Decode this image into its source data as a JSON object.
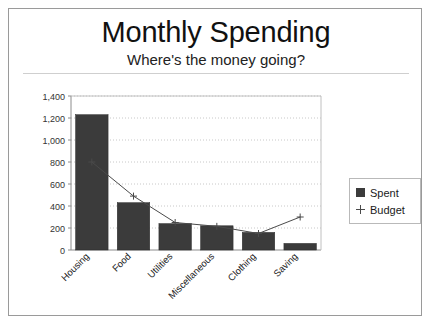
{
  "card": {
    "title": "Monthly Spending",
    "subtitle": "Where's the money going?"
  },
  "legend": {
    "position": "right",
    "items": [
      {
        "label": "Spent",
        "marker": "filled-square",
        "color": "#3b3b3b"
      },
      {
        "label": "Budget",
        "marker": "plus",
        "color": "#4a4a4a"
      }
    ]
  },
  "axis": {
    "y_ticks": [
      "0",
      "200",
      "400",
      "600",
      "800",
      "1,000",
      "1,200",
      "1,400"
    ],
    "x_ticks": [
      "Housing",
      "Food",
      "Utilities",
      "Miscellaneous",
      "Clothing",
      "Saving"
    ]
  },
  "chart_data": {
    "type": "bar",
    "title": "Monthly Spending",
    "subtitle": "Where's the money going?",
    "categories": [
      "Housing",
      "Food",
      "Utilities",
      "Miscellaneous",
      "Clothing",
      "Saving"
    ],
    "series": [
      {
        "name": "Spent",
        "type": "bar",
        "values": [
          1230,
          430,
          240,
          220,
          160,
          60
        ],
        "color": "#3b3b3b"
      },
      {
        "name": "Budget",
        "type": "line",
        "marker": "plus",
        "values": [
          800,
          490,
          250,
          215,
          150,
          300
        ],
        "color": "#4a4a4a"
      }
    ],
    "xlabel": "",
    "ylabel": "",
    "ylim": [
      0,
      1400
    ],
    "ytick_step": 200,
    "grid": true,
    "grid_style": "dotted-horizontal",
    "legend_position": "right",
    "xtick_rotation": -45
  }
}
